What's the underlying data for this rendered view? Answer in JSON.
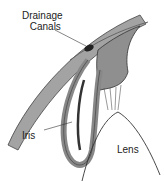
{
  "diagram": {
    "labels": {
      "drainage_line1": "Drainage",
      "drainage_line2": "Canals",
      "iris": "Iris",
      "lens": "Lens"
    },
    "colors": {
      "tissue": "#8a8a8a",
      "tissue_dark": "#4a4a4a",
      "tissue_light": "#b5b5b5",
      "outline": "#333333",
      "text": "#222222"
    }
  }
}
